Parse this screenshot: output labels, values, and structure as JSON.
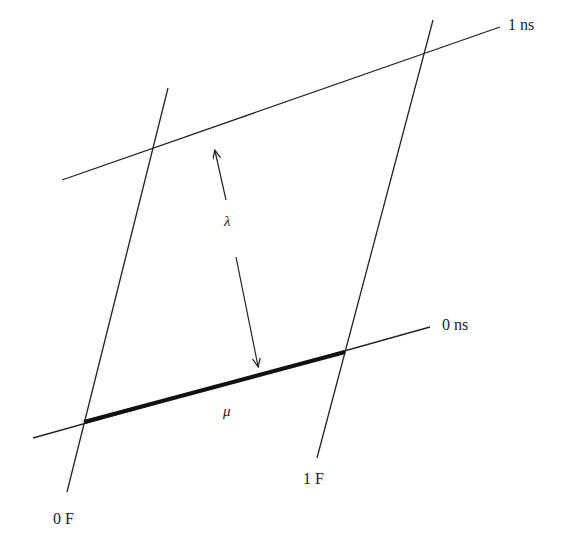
{
  "diagram": {
    "lines": {
      "time_1ns": {
        "label": "1 ns",
        "x1": 62,
        "y1": 180,
        "x2": 500,
        "y2": 27
      },
      "time_0ns": {
        "label": "0 ns",
        "x1": 33,
        "y1": 438,
        "x2": 430,
        "y2": 327
      },
      "space_0F": {
        "label": "0 F",
        "x1": 67,
        "y1": 492,
        "x2": 168,
        "y2": 88
      },
      "space_1F": {
        "label": "1 F",
        "x1": 317,
        "y1": 458,
        "x2": 433,
        "y2": 20
      },
      "mu_segment": {
        "label": "μ",
        "x1": 84,
        "y1": 422,
        "x2": 345,
        "y2": 352
      }
    },
    "labels": {
      "one_ns": "1 ns",
      "zero_ns": "0 ns",
      "zero_F": "0 F",
      "one_F": "1 F",
      "lambda": "λ",
      "mu": "μ"
    },
    "colors": {
      "stroke": "#222222",
      "background": "#ffffff"
    }
  }
}
